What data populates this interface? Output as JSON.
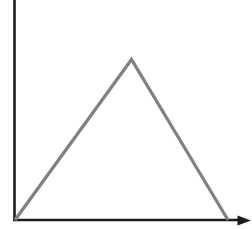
{
  "figure": {
    "background_color": "#ffffff",
    "width": 252,
    "height": 229
  },
  "axes": {
    "origin": {
      "x": 14.5,
      "y": 220.0
    },
    "color": "#1c1c1c",
    "stroke_width": 2.6,
    "y_axis": {
      "name": "y-axis",
      "x": 14.5,
      "y_top": 0,
      "y_bottom": 221,
      "has_arrowhead": false,
      "label": ""
    },
    "x_axis": {
      "name": "x-axis",
      "y": 220.0,
      "x_left": 13.2,
      "x_right": 243.0,
      "has_arrowhead": true,
      "label": ""
    },
    "arrowhead": {
      "name": "x-axis-arrowhead",
      "color": "#1c1c1c",
      "tip": {
        "x": 251.0,
        "y": 220.5
      },
      "back_top": {
        "x": 237.5,
        "y": 215.5
      },
      "back_bottom": {
        "x": 237.5,
        "y": 225.5
      }
    }
  },
  "chart_data": {
    "type": "line",
    "title": "",
    "xlabel": "",
    "ylabel": "",
    "grid": false,
    "legend": null,
    "series": [
      {
        "name": "triangular-waveform",
        "color": "#808080",
        "stroke_width": 3.2,
        "points": [
          {
            "x": 15.0,
            "y": 220.0
          },
          {
            "x": 131.5,
            "y": 59.5
          },
          {
            "x": 228.0,
            "y": 220.0
          }
        ]
      }
    ],
    "annotations": []
  }
}
